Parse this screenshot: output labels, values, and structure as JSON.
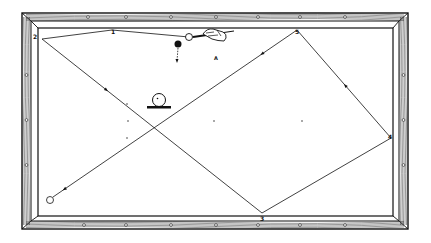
{
  "diagram": {
    "colors": {
      "ink": "#111111",
      "paper": "#ffffff",
      "wood_grain": "#333333"
    },
    "table": {
      "frame": {
        "x": 22,
        "y": 13,
        "w": 386,
        "h": 216
      },
      "cushion": {
        "x": 38,
        "y": 28,
        "w": 355,
        "h": 188
      },
      "diamonds_top": [
        88,
        126,
        171,
        216,
        258,
        300,
        345
      ],
      "diamonds_bottom": [
        84,
        126,
        171,
        216,
        258,
        300,
        345
      ],
      "diamonds_left": [
        75,
        120,
        165
      ],
      "diamonds_right": [
        75,
        120,
        165
      ]
    },
    "spots": [
      {
        "x": 128,
        "y": 121
      },
      {
        "x": 214,
        "y": 121
      },
      {
        "x": 302,
        "y": 121
      },
      {
        "x": 127,
        "y": 104
      },
      {
        "x": 127,
        "y": 138
      }
    ],
    "rail_points": [
      {
        "label": "1",
        "x": 112,
        "y": 30
      },
      {
        "label": "2",
        "x": 42,
        "y": 39
      },
      {
        "label": "3",
        "x": 262,
        "y": 213
      },
      {
        "label": "4",
        "x": 391,
        "y": 138
      },
      {
        "label": "5",
        "x": 297,
        "y": 30
      }
    ],
    "balls": {
      "cue_ball": {
        "x": 189,
        "y": 37,
        "r": 3.5,
        "filled": false
      },
      "object_ball": {
        "x": 178,
        "y": 44,
        "r": 3.5,
        "filled": true
      },
      "final_ball": {
        "x": 50,
        "y": 200,
        "r": 3.5,
        "filled": false
      },
      "inset_ball": {
        "x": 159,
        "y": 100,
        "r": 6.5,
        "filled": false
      }
    },
    "annotation_letter": "A",
    "shot_path": [
      [
        189,
        37
      ],
      [
        112,
        30
      ],
      [
        42,
        39
      ],
      [
        262,
        213
      ],
      [
        391,
        138
      ],
      [
        297,
        30
      ],
      [
        53,
        197
      ]
    ]
  }
}
